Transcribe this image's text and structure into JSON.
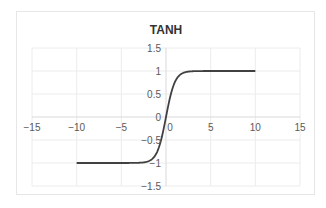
{
  "chart_data": {
    "type": "line",
    "title": "TANH",
    "xlabel": "",
    "ylabel": "",
    "xlim": [
      -15,
      15
    ],
    "ylim": [
      -1.5,
      1.5
    ],
    "x_ticks": [
      -15,
      -10,
      -5,
      0,
      5,
      10,
      15
    ],
    "y_ticks": [
      -1.5,
      -1,
      -0.5,
      0,
      0.5,
      1,
      1.5
    ],
    "x_tick_labels": [
      "−15",
      "−10",
      "−5",
      "0",
      "5",
      "10",
      "15"
    ],
    "y_tick_labels": [
      "−1.5",
      "−1",
      "−0.5",
      "0",
      "0.5",
      "1",
      "1.5"
    ],
    "grid": true,
    "legend": "none",
    "series": [
      {
        "name": "tanh(x)",
        "color": "#404040",
        "function": "tanh",
        "x_range": [
          -10,
          10
        ],
        "x": [
          -10,
          -5,
          -3,
          -2,
          -1.5,
          -1,
          -0.5,
          0,
          0.5,
          1,
          1.5,
          2,
          3,
          5,
          10
        ],
        "y": [
          -1,
          -0.9999,
          -0.995,
          -0.964,
          -0.905,
          -0.762,
          -0.462,
          0,
          0.462,
          0.762,
          0.905,
          0.964,
          0.995,
          0.9999,
          1
        ]
      }
    ]
  }
}
